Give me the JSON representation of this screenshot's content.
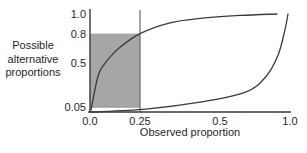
{
  "chart_data": {
    "type": "line",
    "title": "",
    "xlabel": "Observed proportion",
    "ylabel": "Possible alternative proportions",
    "ylabel_lines": [
      "Possible",
      "alternative",
      "proportions"
    ],
    "xlim": [
      0,
      1
    ],
    "ylim": [
      0,
      1
    ],
    "grid": false,
    "legend": false,
    "x_ticks": [
      {
        "value": 0.0,
        "label": "0.0",
        "pos": 0.0
      },
      {
        "value": 0.25,
        "label": "0.25",
        "pos": 0.25
      },
      {
        "value": 0.5,
        "label": "0.5",
        "pos": 0.65
      },
      {
        "value": 1.0,
        "label": "1.0",
        "pos": 1.0
      }
    ],
    "y_ticks": [
      {
        "value": 1.0,
        "label": "1.0"
      },
      {
        "value": 0.8,
        "label": "0.8"
      },
      {
        "value": 0.5,
        "label": "0.5"
      },
      {
        "value": 0.05,
        "label": "0.05"
      }
    ],
    "series": [
      {
        "name": "upper-bound",
        "color": "#3a3a3a",
        "points": [
          [
            0.005,
            0.02
          ],
          [
            0.03,
            0.28
          ],
          [
            0.05,
            0.42
          ],
          [
            0.1,
            0.56
          ],
          [
            0.15,
            0.66
          ],
          [
            0.25,
            0.8
          ],
          [
            0.4,
            0.91
          ],
          [
            0.55,
            0.955
          ],
          [
            0.75,
            0.985
          ],
          [
            0.935,
            1.0
          ]
        ]
      },
      {
        "name": "lower-bound",
        "color": "#3a3a3a",
        "points": [
          [
            0.005,
            0.0
          ],
          [
            0.28,
            0.03
          ],
          [
            0.55,
            0.1
          ],
          [
            0.775,
            0.2
          ],
          [
            0.875,
            0.35
          ],
          [
            0.94,
            0.58
          ],
          [
            0.975,
            0.84
          ],
          [
            0.99,
            1.0
          ]
        ]
      }
    ],
    "shaded_region": {
      "x": [
        0,
        0.25
      ],
      "y": [
        0.05,
        0.8
      ],
      "fill": "#a6a6a6"
    },
    "vertical_line_x": 0.25,
    "colors": {
      "axis": "#3a3a3a",
      "curve": "#3a3a3a",
      "shade": "#a6a6a6",
      "shade_edge": "#8f8f8f",
      "vline": "#6b6b6b",
      "text": "#1f1f1f",
      "background": "#ffffff"
    }
  }
}
